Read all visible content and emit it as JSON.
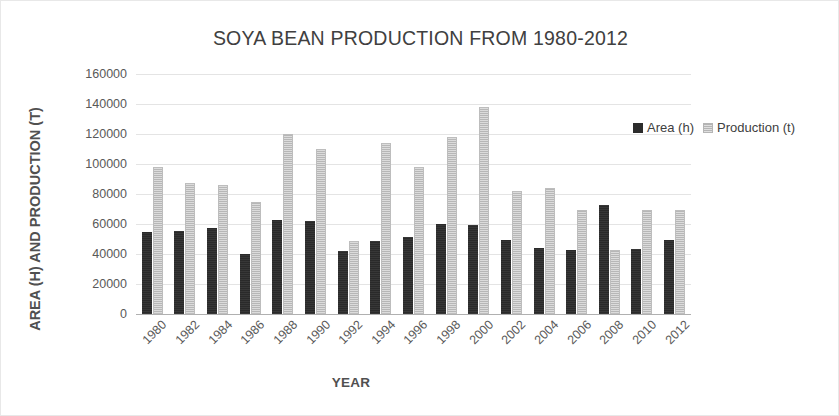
{
  "chart_data": {
    "type": "bar",
    "title": "SOYA BEAN PRODUCTION FROM 1980-2012",
    "xlabel": "YEAR",
    "ylabel": "AREA (H) AND PRODUCTION (T)",
    "ylim": [
      0,
      160000
    ],
    "ytick_step": 20000,
    "yticks": [
      "160000",
      "140000",
      "120000",
      "100000",
      "80000",
      "60000",
      "40000",
      "20000",
      "0"
    ],
    "ytick_values": [
      160000,
      140000,
      120000,
      100000,
      80000,
      60000,
      40000,
      20000,
      0
    ],
    "grid": true,
    "legend_position": "top-right",
    "categories": [
      "1980",
      "1982",
      "1984",
      "1986",
      "1988",
      "1990",
      "1992",
      "1994",
      "1996",
      "1998",
      "2000",
      "2002",
      "2004",
      "2006",
      "2008",
      "2010",
      "2012"
    ],
    "series": [
      {
        "name": "Area (h)",
        "color": "#2c2c2c",
        "values": [
          55000,
          55500,
          57500,
          40000,
          63000,
          62000,
          42000,
          49000,
          51500,
          60000,
          59500,
          49500,
          44000,
          42500,
          73000,
          43500,
          49500
        ]
      },
      {
        "name": "Production (t)",
        "color": "#c9c9c9",
        "values": [
          98000,
          87500,
          86000,
          75000,
          120000,
          110000,
          49000,
          114000,
          98000,
          118000,
          138000,
          82000,
          84000,
          69500,
          43000,
          69500,
          69500
        ]
      }
    ]
  },
  "legend": {
    "items": [
      {
        "label": "Area (h)",
        "swatch": "dark-swatch"
      },
      {
        "label": "Production (t)",
        "swatch": "light-swatch"
      }
    ]
  }
}
